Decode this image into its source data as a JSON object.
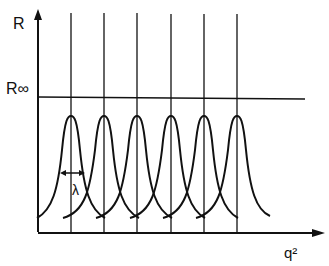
{
  "diagram": {
    "y_axis_label": "R",
    "x_axis_label": "q²",
    "asymptote_label": "R∞",
    "width_label": "λ",
    "peak_count": 6,
    "peak_positions_px": [
      71,
      104,
      137,
      171,
      204,
      237
    ],
    "colors": {
      "line": "#111111",
      "background": "#ffffff"
    }
  }
}
